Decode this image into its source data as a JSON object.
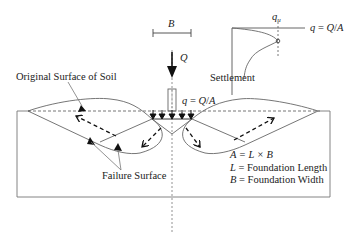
{
  "diagram": {
    "title_labels": {
      "width_symbol": "B",
      "load_symbol": "Q",
      "pressure_label": "q = Q/A",
      "original_surface": "Original Surface of Soil",
      "settlement": "Settlement",
      "failure_surface": "Failure Surface"
    },
    "inset_plot": {
      "ultimate_label": "q",
      "ultimate_subscript": "u",
      "x_axis_label": "q = Q/A",
      "y_axis_label": "Settlement"
    },
    "legend": {
      "line1": "A = L × B",
      "line2_symbol": "L",
      "line2_text": " = Foundation Length",
      "line3_symbol": "B",
      "line3_text": " = Foundation Width"
    },
    "colors": {
      "line": "#555555",
      "arrow": "#111111",
      "box": "#777777"
    }
  }
}
